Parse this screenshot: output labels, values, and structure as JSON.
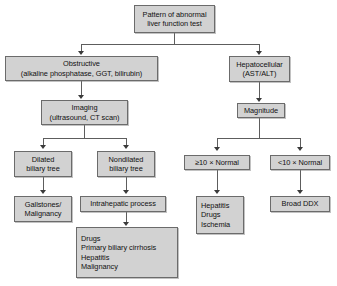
{
  "diagram": {
    "type": "flowchart",
    "colors": {
      "node_fill": "#d2d2d2",
      "node_border": "#6b6b6b",
      "connector": "#5d5d5d",
      "arrow": "#3a3a3a",
      "background": "#ffffff",
      "text": "#111111"
    },
    "nodes": {
      "root": {
        "id": "root",
        "lines": [
          "Pattern of abnormal",
          "liver function test"
        ]
      },
      "obstructive": {
        "id": "obstructive",
        "lines": [
          "Obstructive",
          "(alkaline phosphatase, GGT, bilirubin)"
        ]
      },
      "hepatocellular": {
        "id": "hepatocellular",
        "lines": [
          "Hepatocellular",
          "(AST/ALT)"
        ]
      },
      "imaging": {
        "id": "imaging",
        "lines": [
          "Imaging",
          "(ultrasound, CT scan)"
        ]
      },
      "magnitude": {
        "id": "magnitude",
        "lines": [
          "Magnitude"
        ]
      },
      "dilated": {
        "id": "dilated",
        "lines": [
          "Dilated",
          "biliary tree"
        ]
      },
      "nondilated": {
        "id": "nondilated",
        "lines": [
          "Nondilated",
          "biliary tree"
        ]
      },
      "ge10": {
        "id": "ge10",
        "lines": [
          "≥10 × Normal"
        ]
      },
      "lt10": {
        "id": "lt10",
        "lines": [
          "<10 × Normal"
        ]
      },
      "gallstones": {
        "id": "gallstones",
        "lines": [
          "Gallstones/",
          "Malignancy"
        ]
      },
      "intrahepatic": {
        "id": "intrahepatic",
        "lines": [
          "Intrahepatic process"
        ]
      },
      "hepatitis_list": {
        "id": "hepatitis_list",
        "lines": [
          "Hepatitis",
          "Drugs",
          "Ischemia"
        ]
      },
      "broad_ddx": {
        "id": "broad_ddx",
        "lines": [
          "Broad DDX"
        ]
      },
      "intrahepatic_causes": {
        "id": "intrahepatic_causes",
        "lines": [
          "Drugs",
          "Primary biliary cirrhosis",
          "Hepatitis",
          "Malignancy"
        ]
      }
    },
    "edges": [
      {
        "from": "root",
        "to": "obstructive"
      },
      {
        "from": "root",
        "to": "hepatocellular"
      },
      {
        "from": "obstructive",
        "to": "imaging"
      },
      {
        "from": "hepatocellular",
        "to": "magnitude"
      },
      {
        "from": "imaging",
        "to": "dilated"
      },
      {
        "from": "imaging",
        "to": "nondilated"
      },
      {
        "from": "magnitude",
        "to": "ge10"
      },
      {
        "from": "magnitude",
        "to": "lt10"
      },
      {
        "from": "dilated",
        "to": "gallstones"
      },
      {
        "from": "nondilated",
        "to": "intrahepatic"
      },
      {
        "from": "ge10",
        "to": "hepatitis_list"
      },
      {
        "from": "lt10",
        "to": "broad_ddx"
      },
      {
        "from": "intrahepatic",
        "to": "intrahepatic_causes"
      }
    ]
  }
}
